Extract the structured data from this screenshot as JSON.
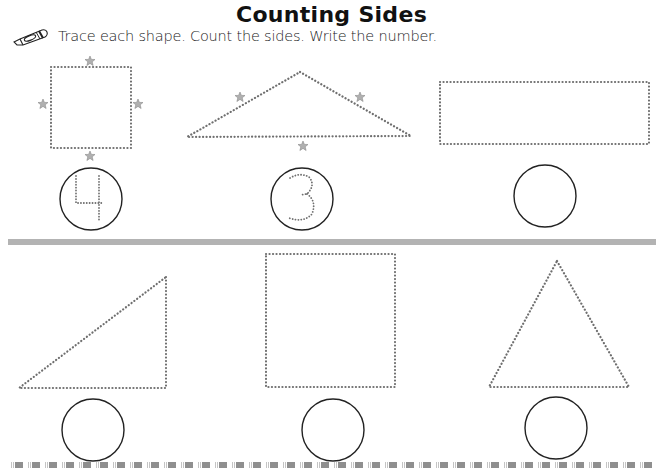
{
  "worksheet": {
    "title": "Counting Sides",
    "instructions": "Trace each shape.  Count the sides.  Write the number.",
    "instruction_icon": "crayon-icon",
    "colors": {
      "dots": "#6f6f6f",
      "stars": "#a8a8a8",
      "circle_stroke": "#222222",
      "divider": "#b3b3b3"
    },
    "rows": [
      {
        "items": [
          {
            "shape": "square",
            "sides_marked_with": "star-icon",
            "answer": "4",
            "answer_style": "dotted-tracing"
          },
          {
            "shape": "triangle",
            "sides_marked_with": "star-icon",
            "answer": "3",
            "answer_style": "dotted-tracing"
          },
          {
            "shape": "rectangle",
            "answer": ""
          }
        ]
      },
      {
        "items": [
          {
            "shape": "right-triangle",
            "answer": ""
          },
          {
            "shape": "square",
            "answer": ""
          },
          {
            "shape": "triangle",
            "answer": ""
          }
        ]
      }
    ]
  }
}
